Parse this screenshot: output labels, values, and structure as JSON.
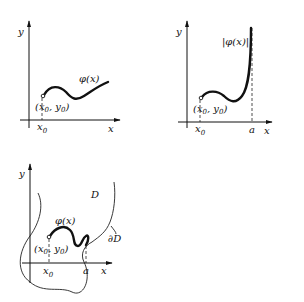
{
  "figure": {
    "panels": [
      {
        "id": "panel-1",
        "axis_labels": {
          "x": "x",
          "y": "y"
        },
        "curve_label": "φ(x)",
        "start_point_label": "(x0, y0)",
        "start_point_text": {
          "open": "(x",
          "sub1": "0",
          "mid": ", y",
          "sub2": "0",
          "close": ")"
        },
        "x_tick": {
          "main": "x",
          "sub": "0"
        }
      },
      {
        "id": "panel-2",
        "axis_labels": {
          "x": "x",
          "y": "y"
        },
        "curve_label": "|φ(x)|",
        "start_point_label": "(x0, y0)",
        "start_point_text": {
          "open": "(x",
          "sub1": "0",
          "mid": ", y",
          "sub2": "0",
          "close": ")"
        },
        "x_tick": {
          "main": "x",
          "sub": "0"
        },
        "end_tick": "a"
      },
      {
        "id": "panel-3",
        "axis_labels": {
          "x": "x",
          "y": "y"
        },
        "curve_label": "φ(x)",
        "start_point_label": "(x0, y0)",
        "start_point_text": {
          "open": "(x",
          "sub1": "0",
          "mid": ", y",
          "sub2": "0",
          "close": ")"
        },
        "x_tick": {
          "main": "x",
          "sub": "0"
        },
        "end_tick": "a",
        "domain_label": "D",
        "boundary_label": "∂D"
      }
    ]
  }
}
